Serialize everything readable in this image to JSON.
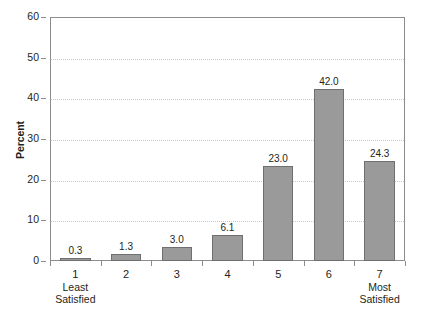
{
  "chart_data": {
    "type": "bar",
    "title": "",
    "subtitle": "",
    "xlabel": "",
    "ylabel": "Percent",
    "categories": [
      "1",
      "2",
      "3",
      "4",
      "5",
      "6",
      "7"
    ],
    "values": [
      0.3,
      1.3,
      3.0,
      6.1,
      23.0,
      42.0,
      24.3
    ],
    "data_labels": [
      "0.3",
      "1.3",
      "3.0",
      "6.1",
      "23.0",
      "42.0",
      "24.3"
    ],
    "category_sublabels": [
      [
        "Least",
        "Satisfied"
      ],
      [],
      [],
      [],
      [],
      [],
      [
        "Most",
        "Satisfied"
      ]
    ],
    "ylim": [
      0,
      60
    ],
    "ytick_values": [
      0,
      10,
      20,
      30,
      40,
      50,
      60
    ],
    "ytick_labels": [
      "0",
      "10",
      "20",
      "30",
      "40",
      "50",
      "60"
    ],
    "grid": true,
    "grid_axis": "y",
    "legend": false,
    "legend_position": "none",
    "bar_color": "#9a9a9a",
    "bar_edge_color": "#6f6f6f",
    "grid_color": "#c9c9c9",
    "axis_color": "#8c8c8c",
    "text_color": "#231f20",
    "background_color": "#ffffff"
  }
}
